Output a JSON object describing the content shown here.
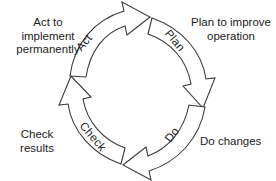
{
  "diagram": {
    "type": "cyclical-process",
    "direction": "clockwise",
    "background_color": "#ffffff",
    "stroke_color": "#3a3a3a",
    "text_color": "#1c1c1c",
    "center": {
      "x": 138,
      "y": 91
    },
    "inner_radius": 46,
    "outer_radius": 70,
    "stages": [
      {
        "id": "plan",
        "arc_label": "Plan",
        "description": "Plan to improve\noperation",
        "arc_position": "upper-right",
        "label_rotation_deg": 45,
        "arrow_points_to": "do"
      },
      {
        "id": "do",
        "arc_label": "Do",
        "description": "Do changes",
        "arc_position": "lower-right",
        "label_rotation_deg": -45,
        "arrow_points_to": "check"
      },
      {
        "id": "check",
        "arc_label": "Check",
        "description": "Check\nresults",
        "arc_position": "lower-left",
        "label_rotation_deg": 45,
        "arrow_points_to": "act"
      },
      {
        "id": "act",
        "arc_label": "Act",
        "description": "Act to\nimplement\npermanently",
        "arc_position": "upper-left",
        "label_rotation_deg": -45,
        "arrow_points_to": "plan"
      }
    ]
  }
}
